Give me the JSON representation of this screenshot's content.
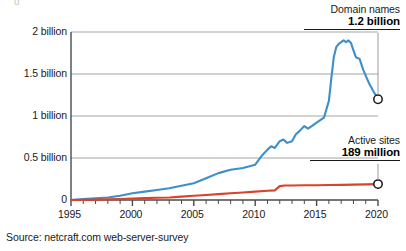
{
  "cut_title_fragment": "g",
  "source": "Source: netcraft.com web-server-survey",
  "annotations": {
    "domain": {
      "name": "Domain names",
      "value": "1.2 billion"
    },
    "active": {
      "name": "Active sites",
      "value": "189 million"
    }
  },
  "colors": {
    "domain_names": "#3d8fc9",
    "active_sites": "#d9432a",
    "axis": "#6b6b6b",
    "gridline": "#9a9a9a",
    "text": "#1a1a1a"
  },
  "chart_data": {
    "type": "line",
    "title": "",
    "xlabel": "",
    "ylabel": "",
    "xlim": [
      1995,
      2020
    ],
    "ylim": [
      0,
      2000000000
    ],
    "grid": true,
    "legend": "annotated-endpoints",
    "ytick_labels": [
      "0",
      "0.5 billion",
      "1 billion",
      "1.5 billion",
      "2 billion"
    ],
    "ytick_values": [
      0,
      500000000,
      1000000000,
      1500000000,
      2000000000
    ],
    "xtick_labels": [
      "1995",
      "2000",
      "2005",
      "2010",
      "2015",
      "2020"
    ],
    "xtick_values": [
      1995,
      2000,
      2005,
      2010,
      2015,
      2020
    ],
    "x_minor_tick_interval": 1,
    "units": "billions",
    "series": [
      {
        "name": "Domain names",
        "color": "#3d8fc9",
        "end_label": "1.2 billion",
        "end_value": 1.2,
        "end_marker": "open-circle",
        "x": [
          1995,
          1996,
          1997,
          1998,
          1999,
          2000,
          2001,
          2002,
          2003,
          2004,
          2005,
          2006,
          2007,
          2008,
          2009,
          2010,
          2010.5,
          2011,
          2011.3,
          2011.6,
          2012,
          2012.3,
          2012.6,
          2013,
          2013.3,
          2013.6,
          2014,
          2014.3,
          2014.6,
          2015,
          2015.3,
          2015.6,
          2016,
          2016.2,
          2016.4,
          2016.6,
          2016.8,
          2017,
          2017.2,
          2017.4,
          2017.6,
          2017.8,
          2018,
          2018.2,
          2018.5,
          2018.8,
          2019,
          2019.3,
          2019.6,
          2020
        ],
        "values": [
          0.0,
          0.01,
          0.02,
          0.03,
          0.05,
          0.08,
          0.1,
          0.12,
          0.14,
          0.17,
          0.2,
          0.26,
          0.32,
          0.36,
          0.38,
          0.42,
          0.52,
          0.6,
          0.64,
          0.62,
          0.7,
          0.72,
          0.68,
          0.7,
          0.78,
          0.82,
          0.88,
          0.85,
          0.88,
          0.92,
          0.95,
          0.98,
          1.18,
          1.45,
          1.7,
          1.82,
          1.86,
          1.88,
          1.9,
          1.88,
          1.9,
          1.87,
          1.78,
          1.7,
          1.68,
          1.55,
          1.48,
          1.38,
          1.3,
          1.2
        ]
      },
      {
        "name": "Active sites",
        "color": "#d9432a",
        "end_label": "189 million",
        "end_value": 0.189,
        "end_marker": "open-circle",
        "x": [
          1995,
          1996,
          1997,
          1998,
          1999,
          2000,
          2001,
          2002,
          2003,
          2004,
          2005,
          2006,
          2007,
          2008,
          2009,
          2010,
          2011,
          2011.6,
          2012,
          2012.4,
          2013,
          2014,
          2015,
          2016,
          2017,
          2018,
          2019,
          2020
        ],
        "values": [
          0.0,
          0.002,
          0.004,
          0.008,
          0.012,
          0.018,
          0.022,
          0.026,
          0.03,
          0.04,
          0.05,
          0.06,
          0.07,
          0.08,
          0.09,
          0.1,
          0.11,
          0.115,
          0.165,
          0.172,
          0.173,
          0.175,
          0.176,
          0.178,
          0.18,
          0.183,
          0.186,
          0.189
        ]
      }
    ]
  }
}
